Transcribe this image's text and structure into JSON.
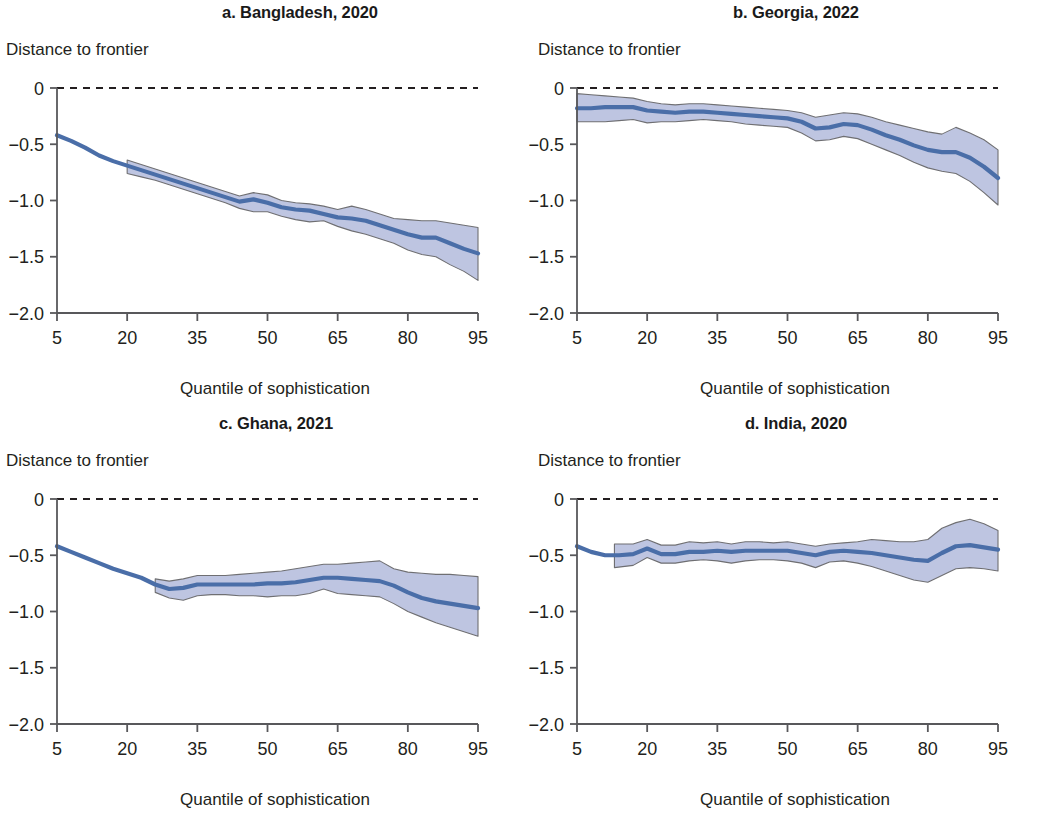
{
  "figure": {
    "axis_title_y": "Distance to frontier",
    "axis_title_x": "Quantile of sophistication",
    "line_color": "#4a6ea8",
    "band_fill": "#b9c0de",
    "band_stroke": "#6f6f72",
    "zero_line_color": "#231f20",
    "axis_color": "#58585b"
  },
  "axes": {
    "x_ticks": [
      "5",
      "20",
      "35",
      "50",
      "65",
      "80",
      "95"
    ],
    "x_tick_values": [
      5,
      20,
      35,
      50,
      65,
      80,
      95
    ],
    "y_ticks": [
      "0",
      "−0.5",
      "−1.0",
      "−1.5",
      "−2.0"
    ],
    "y_tick_values": [
      0,
      -0.5,
      -1.0,
      -1.5,
      -2.0
    ],
    "xlim": [
      5,
      95
    ],
    "ylim": [
      -2.0,
      0
    ]
  },
  "chart_data": [
    {
      "id": "panel-a",
      "type": "line",
      "title": "a. Bangladesh, 2020",
      "xlabel": "Quantile of sophistication",
      "ylabel": "Distance to frontier",
      "xlim": [
        5,
        95
      ],
      "ylim": [
        -2.0,
        0
      ],
      "grid": false,
      "legend": "none",
      "zero_reference_line": 0,
      "series": [
        {
          "name": "Distance to frontier (point estimate)",
          "x": [
            5,
            8,
            11,
            14,
            17,
            20,
            23,
            26,
            29,
            32,
            35,
            38,
            41,
            44,
            47,
            50,
            53,
            56,
            59,
            62,
            65,
            68,
            71,
            74,
            77,
            80,
            83,
            86,
            89,
            92,
            95
          ],
          "values": [
            -0.42,
            -0.47,
            -0.53,
            -0.6,
            -0.65,
            -0.69,
            -0.73,
            -0.77,
            -0.81,
            -0.85,
            -0.89,
            -0.93,
            -0.97,
            -1.01,
            -0.99,
            -1.02,
            -1.06,
            -1.08,
            -1.09,
            -1.12,
            -1.15,
            -1.16,
            -1.18,
            -1.22,
            -1.26,
            -1.3,
            -1.33,
            -1.33,
            -1.38,
            -1.43,
            -1.47
          ]
        }
      ],
      "confidence_band": {
        "name": "Confidence interval",
        "x_start": 20,
        "x": [
          20,
          23,
          26,
          29,
          32,
          35,
          38,
          41,
          44,
          47,
          50,
          53,
          56,
          59,
          62,
          65,
          68,
          71,
          74,
          77,
          80,
          83,
          86,
          89,
          92,
          95
        ],
        "upper": [
          -0.64,
          -0.68,
          -0.72,
          -0.76,
          -0.8,
          -0.84,
          -0.88,
          -0.92,
          -0.96,
          -0.93,
          -0.95,
          -1.0,
          -1.02,
          -1.03,
          -1.05,
          -1.08,
          -1.05,
          -1.08,
          -1.12,
          -1.16,
          -1.17,
          -1.18,
          -1.18,
          -1.2,
          -1.22,
          -1.24
        ],
        "lower": [
          -0.76,
          -0.79,
          -0.82,
          -0.86,
          -0.9,
          -0.94,
          -0.98,
          -1.02,
          -1.07,
          -1.1,
          -1.1,
          -1.14,
          -1.17,
          -1.19,
          -1.18,
          -1.23,
          -1.27,
          -1.3,
          -1.34,
          -1.38,
          -1.44,
          -1.48,
          -1.5,
          -1.57,
          -1.63,
          -1.71
        ]
      }
    },
    {
      "id": "panel-b",
      "type": "line",
      "title": "b. Georgia, 2022",
      "xlabel": "Quantile of sophistication",
      "ylabel": "Distance to frontier",
      "xlim": [
        5,
        95
      ],
      "ylim": [
        -2.0,
        0
      ],
      "grid": false,
      "legend": "none",
      "zero_reference_line": 0,
      "series": [
        {
          "name": "Distance to frontier (point estimate)",
          "x": [
            5,
            8,
            11,
            14,
            17,
            20,
            23,
            26,
            29,
            32,
            35,
            38,
            41,
            44,
            47,
            50,
            53,
            56,
            59,
            62,
            65,
            68,
            71,
            74,
            77,
            80,
            83,
            86,
            89,
            92,
            95
          ],
          "values": [
            -0.18,
            -0.18,
            -0.17,
            -0.17,
            -0.17,
            -0.2,
            -0.21,
            -0.22,
            -0.21,
            -0.21,
            -0.22,
            -0.23,
            -0.24,
            -0.25,
            -0.26,
            -0.27,
            -0.3,
            -0.36,
            -0.35,
            -0.32,
            -0.33,
            -0.37,
            -0.42,
            -0.46,
            -0.51,
            -0.55,
            -0.57,
            -0.57,
            -0.62,
            -0.7,
            -0.8
          ]
        }
      ],
      "confidence_band": {
        "name": "Confidence interval",
        "x_start": 5,
        "x": [
          5,
          8,
          11,
          14,
          17,
          20,
          23,
          26,
          29,
          32,
          35,
          38,
          41,
          44,
          47,
          50,
          53,
          56,
          59,
          62,
          65,
          68,
          71,
          74,
          77,
          80,
          83,
          86,
          89,
          92,
          95
        ],
        "upper": [
          -0.05,
          -0.06,
          -0.07,
          -0.08,
          -0.09,
          -0.12,
          -0.14,
          -0.15,
          -0.14,
          -0.14,
          -0.15,
          -0.16,
          -0.17,
          -0.18,
          -0.19,
          -0.2,
          -0.22,
          -0.26,
          -0.24,
          -0.22,
          -0.23,
          -0.26,
          -0.3,
          -0.33,
          -0.36,
          -0.39,
          -0.41,
          -0.35,
          -0.4,
          -0.46,
          -0.55
        ],
        "lower": [
          -0.3,
          -0.3,
          -0.3,
          -0.29,
          -0.28,
          -0.31,
          -0.3,
          -0.3,
          -0.29,
          -0.28,
          -0.29,
          -0.3,
          -0.32,
          -0.33,
          -0.34,
          -0.35,
          -0.4,
          -0.47,
          -0.46,
          -0.43,
          -0.45,
          -0.5,
          -0.55,
          -0.6,
          -0.66,
          -0.71,
          -0.74,
          -0.76,
          -0.83,
          -0.93,
          -1.04
        ]
      }
    },
    {
      "id": "panel-c",
      "type": "line",
      "title": "c. Ghana, 2021",
      "xlabel": "Quantile of sophistication",
      "ylabel": "Distance to frontier",
      "xlim": [
        5,
        95
      ],
      "ylim": [
        -2.0,
        0
      ],
      "grid": false,
      "legend": "none",
      "zero_reference_line": 0,
      "series": [
        {
          "name": "Distance to frontier (point estimate)",
          "x": [
            5,
            8,
            11,
            14,
            17,
            20,
            23,
            26,
            29,
            32,
            35,
            38,
            41,
            44,
            47,
            50,
            53,
            56,
            59,
            62,
            65,
            68,
            71,
            74,
            77,
            80,
            83,
            86,
            89,
            92,
            95
          ],
          "values": [
            -0.42,
            -0.47,
            -0.52,
            -0.57,
            -0.62,
            -0.66,
            -0.7,
            -0.76,
            -0.8,
            -0.79,
            -0.76,
            -0.76,
            -0.76,
            -0.76,
            -0.76,
            -0.75,
            -0.75,
            -0.74,
            -0.72,
            -0.7,
            -0.7,
            -0.71,
            -0.72,
            -0.73,
            -0.77,
            -0.83,
            -0.88,
            -0.91,
            -0.93,
            -0.95,
            -0.97
          ]
        }
      ],
      "confidence_band": {
        "name": "Confidence interval",
        "x_start": 26,
        "x": [
          26,
          29,
          32,
          35,
          38,
          41,
          44,
          47,
          50,
          53,
          56,
          59,
          62,
          65,
          68,
          71,
          74,
          77,
          80,
          83,
          86,
          89,
          92,
          95
        ],
        "upper": [
          -0.71,
          -0.73,
          -0.71,
          -0.68,
          -0.68,
          -0.68,
          -0.67,
          -0.66,
          -0.65,
          -0.64,
          -0.62,
          -0.6,
          -0.58,
          -0.58,
          -0.57,
          -0.56,
          -0.55,
          -0.62,
          -0.65,
          -0.66,
          -0.67,
          -0.67,
          -0.68,
          -0.69
        ],
        "lower": [
          -0.83,
          -0.88,
          -0.9,
          -0.86,
          -0.85,
          -0.85,
          -0.86,
          -0.86,
          -0.87,
          -0.86,
          -0.86,
          -0.84,
          -0.8,
          -0.84,
          -0.85,
          -0.86,
          -0.87,
          -0.93,
          -1.0,
          -1.05,
          -1.1,
          -1.14,
          -1.18,
          -1.22
        ]
      }
    },
    {
      "id": "panel-d",
      "type": "line",
      "title": "d. India, 2020",
      "xlabel": "Quantile of sophistication",
      "ylabel": "Distance to frontier",
      "xlim": [
        5,
        95
      ],
      "ylim": [
        -2.0,
        0
      ],
      "grid": false,
      "legend": "none",
      "zero_reference_line": 0,
      "series": [
        {
          "name": "Distance to frontier (point estimate)",
          "x": [
            5,
            8,
            11,
            14,
            17,
            20,
            23,
            26,
            29,
            32,
            35,
            38,
            41,
            44,
            47,
            50,
            53,
            56,
            59,
            62,
            65,
            68,
            71,
            74,
            77,
            80,
            83,
            86,
            89,
            92,
            95
          ],
          "values": [
            -0.42,
            -0.47,
            -0.5,
            -0.5,
            -0.49,
            -0.44,
            -0.49,
            -0.49,
            -0.47,
            -0.47,
            -0.46,
            -0.47,
            -0.46,
            -0.46,
            -0.46,
            -0.46,
            -0.48,
            -0.5,
            -0.47,
            -0.46,
            -0.47,
            -0.48,
            -0.5,
            -0.52,
            -0.54,
            -0.55,
            -0.48,
            -0.42,
            -0.41,
            -0.43,
            -0.45
          ]
        }
      ],
      "confidence_band": {
        "name": "Confidence interval",
        "x_start": 13,
        "x": [
          13,
          17,
          20,
          23,
          26,
          29,
          32,
          35,
          38,
          41,
          44,
          47,
          50,
          53,
          56,
          59,
          62,
          65,
          68,
          71,
          74,
          77,
          80,
          83,
          86,
          89,
          92,
          95
        ],
        "upper": [
          -0.4,
          -0.4,
          -0.36,
          -0.41,
          -0.41,
          -0.38,
          -0.39,
          -0.38,
          -0.4,
          -0.38,
          -0.38,
          -0.39,
          -0.38,
          -0.4,
          -0.42,
          -0.4,
          -0.39,
          -0.38,
          -0.36,
          -0.37,
          -0.38,
          -0.38,
          -0.36,
          -0.26,
          -0.21,
          -0.18,
          -0.22,
          -0.28
        ],
        "lower": [
          -0.61,
          -0.59,
          -0.52,
          -0.57,
          -0.57,
          -0.55,
          -0.54,
          -0.55,
          -0.57,
          -0.55,
          -0.54,
          -0.54,
          -0.55,
          -0.57,
          -0.61,
          -0.56,
          -0.55,
          -0.57,
          -0.6,
          -0.64,
          -0.68,
          -0.72,
          -0.74,
          -0.68,
          -0.62,
          -0.61,
          -0.62,
          -0.64
        ]
      }
    }
  ]
}
